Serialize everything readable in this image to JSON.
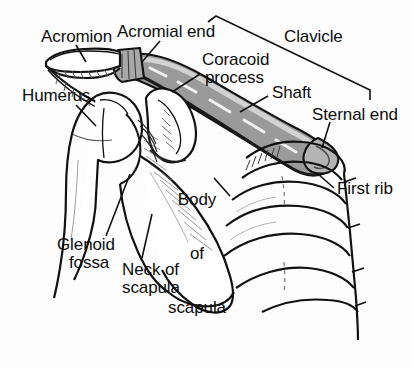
{
  "figure": {
    "background_color": "#fdfdfd",
    "ink_color": "#0d0d0d",
    "bone_fill_color": "#ffffff",
    "clavicle_shade_color": "#8d8d8d",
    "clavicle_shade_light": "#b8b8b8"
  },
  "labels": {
    "acromion": "Acromion",
    "acromial_end": "Acromial end",
    "clavicle": "Clavicle",
    "coracoid_line1": "Coracoid",
    "coracoid_line2": "process",
    "humerus": "Humerus",
    "shaft": "Shaft",
    "sternal_end": "Sternal end",
    "body_of_scapula_line1": "Body",
    "body_of_scapula_line2": "of",
    "body_of_scapula_line3": "scapula",
    "first_rib": "First rib",
    "glenoid_line1": "Glenoid",
    "glenoid_line2": "fossa",
    "neck_of_scapula_line1": "Neck of",
    "neck_of_scapula_line2": "scapula"
  }
}
